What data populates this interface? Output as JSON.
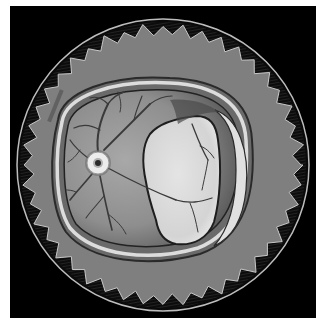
{
  "image": {
    "subject": "Illustration of a retina (fundus) with retinal detachment, framed in a coin-like circular border with serrated edge",
    "width": 326,
    "height": 330
  },
  "colors": {
    "page_background": "#ffffff",
    "frame_background": "#000000",
    "outer_rim": "#bdbdbd",
    "serrated_band": "#1a1a1a",
    "gray_ring": "#7f7f7f",
    "retina_rim_light": "#d9d9d9",
    "retina_fundus": "#9a9a9a",
    "detached_region": "#e6e6e6",
    "vessel": "#3a3a3a",
    "optic_disc_ring": "#e8e8e8",
    "optic_disc_center": "#2a2a2a"
  },
  "elements": {
    "signature": "",
    "optic_disc": {
      "cx": 98,
      "cy": 163,
      "r": 12
    },
    "coin": {
      "cx": 163,
      "cy": 165,
      "r": 146
    }
  }
}
